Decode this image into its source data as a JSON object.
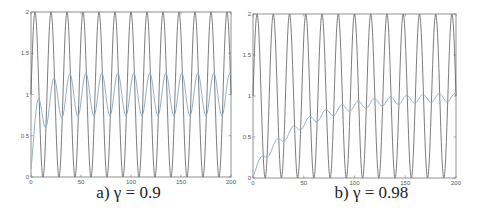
{
  "chart_data": [
    {
      "type": "line",
      "title": "",
      "caption": "a) γ = 0.9",
      "xlabel": "",
      "ylabel": "",
      "xlim": [
        0,
        200
      ],
      "ylim": [
        0,
        2
      ],
      "xticks": [
        0,
        50,
        100,
        150,
        200
      ],
      "yticks": [
        0,
        0.5,
        1,
        1.5,
        2
      ],
      "xtick_labels": [
        "0",
        "50",
        "100",
        "150",
        "200"
      ],
      "ytick_labels": [
        "0",
        "0.5",
        "1",
        "1.5",
        "2"
      ],
      "grid": false,
      "legend": "none",
      "gamma": 0.9,
      "series": [
        {
          "name": "input signal",
          "color": "#5a5a5a",
          "formula": "1 + sin(2*pi*t/period)",
          "period": 16,
          "offset": 1,
          "amplitude": 1
        },
        {
          "name": "filtered response",
          "color": "#8fb2cc",
          "formula": "y[n] = gamma*y[n-1] + (1-gamma)*x[n]",
          "sample_step": 4,
          "values_every_4": [
            0.1,
            0.47,
            0.81,
            0.66,
            0.79,
            1.17,
            1.05,
            0.79,
            0.95,
            1.24,
            1.04,
            0.77,
            0.97,
            1.25,
            1.03,
            0.76,
            0.98,
            1.25,
            1.02,
            0.75,
            0.98,
            1.25,
            1.02,
            0.75,
            0.98,
            1.25,
            1.02,
            0.75,
            0.98,
            1.25,
            1.02,
            0.75,
            0.98,
            1.25,
            1.02,
            0.75,
            0.98,
            1.25,
            1.02,
            0.75,
            0.98,
            1.25,
            1.02,
            0.75,
            0.98,
            1.25,
            1.02,
            0.75,
            0.98,
            1.25,
            1.02
          ]
        }
      ]
    },
    {
      "type": "line",
      "title": "",
      "caption": "b) γ = 0.98",
      "xlabel": "",
      "ylabel": "",
      "xlim": [
        0,
        200
      ],
      "ylim": [
        0,
        2
      ],
      "xticks": [
        0,
        50,
        100,
        150,
        200
      ],
      "yticks": [
        0,
        0.5,
        1,
        1.5,
        2
      ],
      "xtick_labels": [
        "0",
        "50",
        "100",
        "150",
        "200"
      ],
      "ytick_labels": [
        "0",
        "0.5",
        "1",
        "1.5",
        "2"
      ],
      "grid": false,
      "legend": "none",
      "gamma": 0.98,
      "series": [
        {
          "name": "input signal",
          "color": "#5a5a5a",
          "formula": "1 + sin(2*pi*t/period)",
          "period": 16,
          "offset": 1,
          "amplitude": 1
        },
        {
          "name": "filtered response",
          "color": "#8fb2cc",
          "formula": "y[n] = gamma*y[n-1] + (1-gamma)*x[n]",
          "sample_step": 4,
          "values_every_4": [
            0.02,
            0.1,
            0.24,
            0.27,
            0.28,
            0.39,
            0.47,
            0.46,
            0.47,
            0.57,
            0.63,
            0.61,
            0.61,
            0.69,
            0.74,
            0.71,
            0.71,
            0.78,
            0.82,
            0.79,
            0.79,
            0.85,
            0.88,
            0.84,
            0.84,
            0.89,
            0.92,
            0.88,
            0.87,
            0.93,
            0.95,
            0.91,
            0.9,
            0.95,
            0.97,
            0.93,
            0.92,
            0.97,
            0.98,
            0.94,
            0.93,
            0.98,
            0.99,
            0.95,
            0.94,
            0.98,
            1.0,
            0.95,
            0.95,
            0.99,
            1.0
          ]
        }
      ]
    }
  ]
}
